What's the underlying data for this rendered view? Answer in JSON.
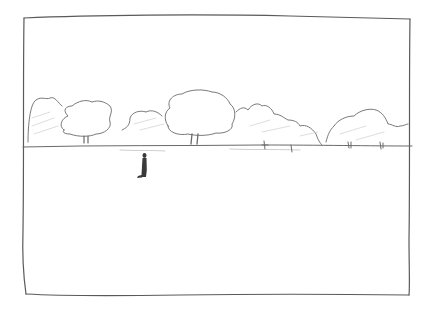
{
  "image": {
    "description": "Pencil sketch storyboard frame: a flat horizon with a line of trees and bushes, and a lone small figure standing in an empty field.",
    "style": "pencil sketch",
    "colors": {
      "paper": "#ffffff",
      "pencil_line": "#5a5a5a",
      "shading": "#c8c8c8",
      "figure": "#3a3a3a"
    },
    "elements": {
      "frame": "rectangular frame border",
      "horizon": "horizon line",
      "trees": [
        "bush cluster left",
        "tree left",
        "bush middle",
        "tree center",
        "bush right-center",
        "bush far right"
      ],
      "figure": "small standing person"
    }
  }
}
